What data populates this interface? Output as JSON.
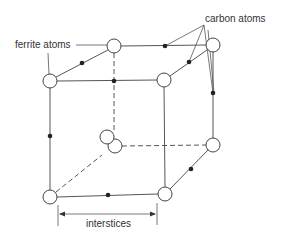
{
  "diagram": {
    "labels": {
      "ferrite": "ferrite atoms",
      "carbon": "carbon atoms",
      "interstices": "interstices"
    },
    "colors": {
      "line": "#555555",
      "atom_fill": "#ffffff",
      "carbon_fill": "#222222",
      "text": "#333333"
    },
    "ferrite_atoms": [
      {
        "id": "front-top-left",
        "x": 50,
        "y": 81
      },
      {
        "id": "back-top-left",
        "x": 114,
        "y": 46
      },
      {
        "id": "back-top-right",
        "x": 213,
        "y": 45
      },
      {
        "id": "front-top-right",
        "x": 164,
        "y": 80
      },
      {
        "id": "front-bottom-left",
        "x": 50,
        "y": 197
      },
      {
        "id": "front-bottom-right",
        "x": 165,
        "y": 194
      },
      {
        "id": "back-bottom-right",
        "x": 213,
        "y": 145
      },
      {
        "id": "back-bottom-left-a",
        "x": 107,
        "y": 137
      },
      {
        "id": "back-bottom-left-b",
        "x": 115,
        "y": 146
      }
    ],
    "carbon_atoms": [
      {
        "x": 82,
        "y": 63
      },
      {
        "x": 114,
        "y": 81
      },
      {
        "x": 165,
        "y": 46
      },
      {
        "x": 189,
        "y": 62
      },
      {
        "x": 213,
        "y": 93
      },
      {
        "x": 50,
        "y": 136
      },
      {
        "x": 108,
        "y": 195
      },
      {
        "x": 191,
        "y": 169
      }
    ]
  }
}
